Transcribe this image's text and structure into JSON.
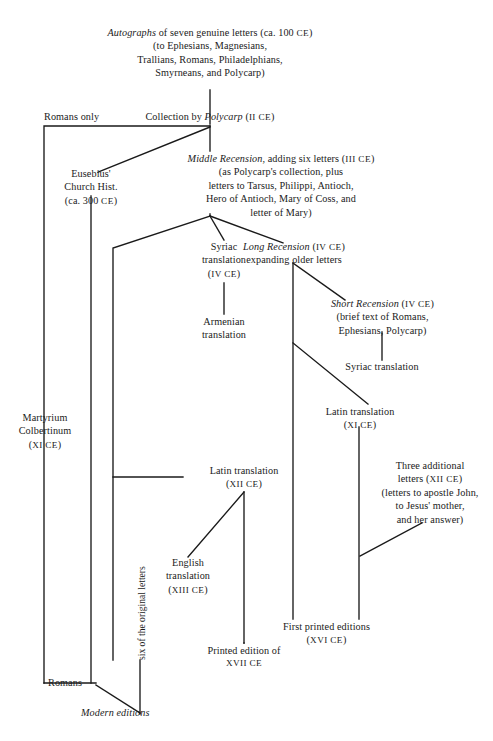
{
  "diagram": {
    "title_node": "autographs",
    "nodes": {
      "autographs": {
        "lines": [
          "Autographs of seven genuine letters (ca. 100 CE)",
          "(to Ephesians, Magnesians,",
          "Trallians, Romans, Philadelphians,",
          "Smyrneans, and Polycarp)"
        ],
        "l1_a": "Autographs",
        "l1_b": " of seven genuine letters (ca. 100 ",
        "l1_c": "CE",
        "l1_d": ")",
        "l2": "(to Ephesians, Magnesians,",
        "l3": "Trallians, Romans, Philadelphians,",
        "l4": "Smyrneans, and Polycarp)"
      },
      "romans_only": {
        "label": "Romans only"
      },
      "polycarp": {
        "a": "Collection by ",
        "b": "Polycarp",
        "c": " (",
        "d": "II CE",
        "e": ")"
      },
      "eusebius": {
        "l1": "Eusebius'",
        "l2": "Church Hist.",
        "l3_a": "(ca. 300 ",
        "l3_b": "CE",
        "l3_c": ")"
      },
      "middle_recension": {
        "l1_a": "Middle Recension",
        "l1_b": ", adding six letters (",
        "l1_c": "III CE",
        "l1_d": ")",
        "l2": "(as Polycarp's collection, plus",
        "l3": "letters to Tarsus, Philippi, Antioch,",
        "l4": "Hero of Antioch, Mary of Coss, and",
        "l5": "letter of Mary)"
      },
      "syriac_translation_iv": {
        "l1": "Syriac",
        "l2": "translation",
        "l3_a": "(",
        "l3_b": "IV CE",
        "l3_c": ")"
      },
      "long_recension": {
        "l1_a": "Long Recension",
        "l1_b": " (",
        "l1_c": "IV CE",
        "l1_d": ")",
        "l2": "expanding older letters"
      },
      "armenian_translation": {
        "l1": "Armenian",
        "l2": "translation"
      },
      "short_recension": {
        "l1_a": "Short Recension",
        "l1_b": " (",
        "l1_c": "IV CE",
        "l1_d": ")",
        "l2": "(brief text of Romans,",
        "l3": "Ephesians, Polycarp)"
      },
      "syriac_translation_plain": {
        "label": "Syriac translation"
      },
      "martyrium": {
        "l1": "Martyrium",
        "l2": "Colbertinum",
        "l3_a": "(",
        "l3_b": "XI CE",
        "l3_c": ")"
      },
      "latin_translation_xi": {
        "l1": "Latin translation",
        "l2_a": "(",
        "l2_b": "XI CE",
        "l2_c": ")"
      },
      "latin_translation_xii": {
        "l1": "Latin translation",
        "l2_a": "(",
        "l2_b": "XII CE",
        "l2_c": ")"
      },
      "three_additional": {
        "l1": "Three additional",
        "l2_a": "letters (",
        "l2_b": "XII CE",
        "l2_c": ")",
        "l3": "(letters to apostle John,",
        "l4": "to Jesus' mother,",
        "l5": "and her answer)"
      },
      "english_translation": {
        "l1": "English",
        "l2": "translation",
        "l3_a": "(",
        "l3_b": "XIII CE",
        "l3_c": ")"
      },
      "first_printed": {
        "l1": "First printed editions",
        "l2_a": "(",
        "l2_b": "XVI CE",
        "l2_c": ")"
      },
      "printed_edition_xvii": {
        "l1": "Printed edition of",
        "l2": "XVII CE"
      },
      "romans_bottom": {
        "label": "Romans"
      },
      "modern_editions": {
        "label": "Modern editions"
      },
      "six_original": {
        "label": "six of the original letters"
      }
    },
    "style": {
      "line_color": "#1a1a1a",
      "background": "#ffffff",
      "text_color": "#1a1a1a"
    }
  }
}
